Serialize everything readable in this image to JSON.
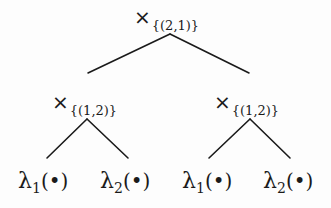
{
  "tree": {
    "root": {
      "operator": "×",
      "subscript": "{(2,1)}"
    },
    "left": {
      "operator": "×",
      "subscript": "{(1,2)}"
    },
    "right": {
      "operator": "×",
      "subscript": "{(1,2)}"
    },
    "leaves": [
      {
        "symbol": "λ",
        "index": "1",
        "arg_open": "(",
        "arg": "•",
        "arg_close": ")"
      },
      {
        "symbol": "λ",
        "index": "2",
        "arg_open": "(",
        "arg": "•",
        "arg_close": ")"
      },
      {
        "symbol": "λ",
        "index": "1",
        "arg_open": "(",
        "arg": "•",
        "arg_close": ")"
      },
      {
        "symbol": "λ",
        "index": "2",
        "arg_open": "(",
        "arg": "•",
        "arg_close": ")"
      }
    ]
  },
  "colors": {
    "ink": "#1a1a1a",
    "background": "#fdfdfd"
  }
}
